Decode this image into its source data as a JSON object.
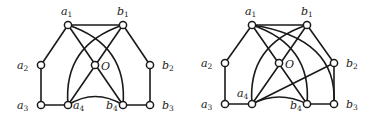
{
  "graphs": [
    {
      "id": "left",
      "nodes": [
        {
          "id": "a1",
          "label": "a",
          "sub": "1",
          "x": 68,
          "y": 25,
          "lx": 61,
          "ly": 15
        },
        {
          "id": "b1",
          "label": "b",
          "sub": "1",
          "x": 123,
          "y": 25,
          "lx": 117,
          "ly": 15
        },
        {
          "id": "a2",
          "label": "a",
          "sub": "2",
          "x": 41,
          "y": 65,
          "lx": 17,
          "ly": 69
        },
        {
          "id": "O",
          "label": "O",
          "sub": "",
          "x": 95,
          "y": 65,
          "lx": 101,
          "ly": 70
        },
        {
          "id": "b2",
          "label": "b",
          "sub": "2",
          "x": 150,
          "y": 65,
          "lx": 162,
          "ly": 69
        },
        {
          "id": "a3",
          "label": "a",
          "sub": "3",
          "x": 41,
          "y": 105,
          "lx": 17,
          "ly": 109
        },
        {
          "id": "a4",
          "label": "a",
          "sub": "4",
          "x": 68,
          "y": 105,
          "lx": 73,
          "ly": 109
        },
        {
          "id": "b4",
          "label": "b",
          "sub": "4",
          "x": 123,
          "y": 105,
          "lx": 106,
          "ly": 109
        },
        {
          "id": "b3",
          "label": "b",
          "sub": "3",
          "x": 150,
          "y": 105,
          "lx": 162,
          "ly": 109
        }
      ],
      "edges": [
        "M68,25 L123,25",
        "M68,25 L41,65",
        "M41,65 L41,105",
        "M41,105 L68,105",
        "M68,25 L123,105",
        "M123,25 L68,105",
        "M123,25 L150,65",
        "M150,65 L150,105",
        "M123,105 L150,105",
        "M68,25 Q128,45 123,105",
        "M123,25 Q63,45 68,105",
        "M68,105 Q95,88 123,105"
      ]
    },
    {
      "id": "right",
      "nodes": [
        {
          "id": "a1",
          "label": "a",
          "sub": "1",
          "x": 252,
          "y": 25,
          "lx": 245,
          "ly": 15
        },
        {
          "id": "b1",
          "label": "b",
          "sub": "1",
          "x": 307,
          "y": 25,
          "lx": 301,
          "ly": 15
        },
        {
          "id": "a2",
          "label": "a",
          "sub": "2",
          "x": 225,
          "y": 63,
          "lx": 201,
          "ly": 67
        },
        {
          "id": "O",
          "label": "O",
          "sub": "",
          "x": 279,
          "y": 63,
          "lx": 285,
          "ly": 68
        },
        {
          "id": "b2",
          "label": "b",
          "sub": "2",
          "x": 334,
          "y": 63,
          "lx": 346,
          "ly": 67
        },
        {
          "id": "a3",
          "label": "a",
          "sub": "3",
          "x": 225,
          "y": 104,
          "lx": 201,
          "ly": 108
        },
        {
          "id": "a4",
          "label": "a",
          "sub": "4",
          "x": 252,
          "y": 104,
          "lx": 237,
          "ly": 97
        },
        {
          "id": "b4",
          "label": "b",
          "sub": "4",
          "x": 307,
          "y": 104,
          "lx": 290,
          "ly": 109
        },
        {
          "id": "b3",
          "label": "b",
          "sub": "3",
          "x": 334,
          "y": 104,
          "lx": 346,
          "ly": 108
        }
      ],
      "edges": [
        "M252,25 L307,25",
        "M252,25 L225,63",
        "M225,63 L225,104",
        "M225,104 L252,104",
        "M252,25 L307,104",
        "M307,25 L252,104",
        "M307,25 L334,63",
        "M334,63 L334,104",
        "M307,104 L334,104",
        "M252,104 L334,63",
        "M252,25 Q312,45 307,104",
        "M252,25 Q338,38 334,104",
        "M307,25 Q247,45 252,104",
        "M252,104 Q279,90 307,104"
      ]
    }
  ]
}
